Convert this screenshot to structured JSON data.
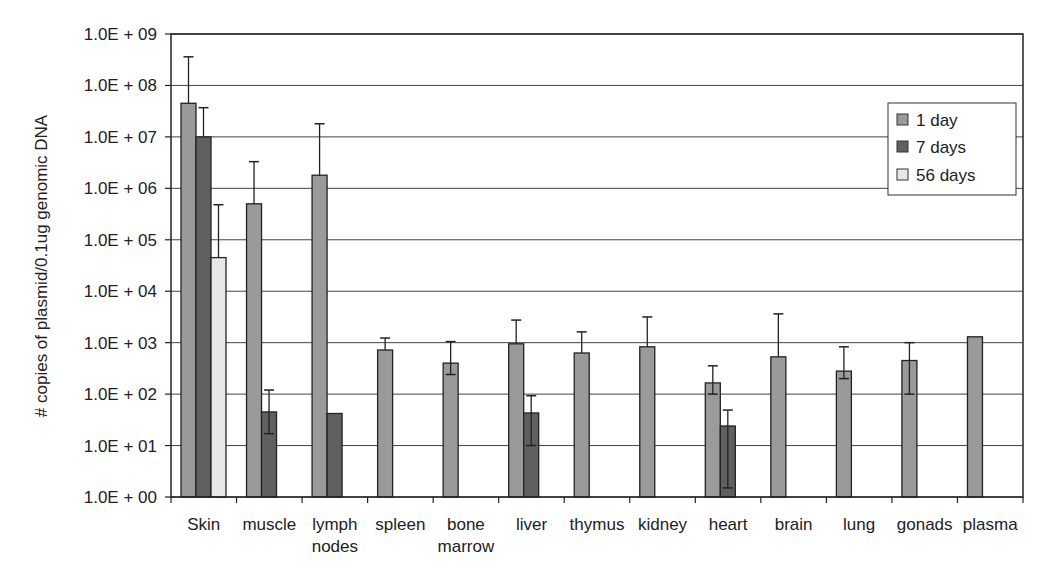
{
  "chart_data": {
    "type": "bar",
    "title": "",
    "xlabel": "",
    "ylabel": "# copies of plasmid/0.1ug genomic DNA",
    "yscale": "log",
    "ylim": [
      1,
      1000000000
    ],
    "yticks": [
      "1.0E + 00",
      "1.0E + 01",
      "1.0E + 02",
      "1.0E + 03",
      "1.0E + 04",
      "1.0E + 05",
      "1.0E + 06",
      "1.0E + 07",
      "1.0E + 08",
      "1.0E + 09"
    ],
    "grid": true,
    "legend_position": "upper right",
    "categories": [
      "Skin",
      "muscle",
      "lymph nodes",
      "spleen",
      "bone marrow",
      "liver",
      "thymus",
      "kidney",
      "heart",
      "brain",
      "lung",
      "gonads",
      "plasma"
    ],
    "category_lines": [
      [
        "Skin"
      ],
      [
        "muscle"
      ],
      [
        "lymph",
        "nodes"
      ],
      [
        "spleen"
      ],
      [
        "bone",
        "marrow"
      ],
      [
        "liver"
      ],
      [
        "thymus"
      ],
      [
        "kidney"
      ],
      [
        "heart"
      ],
      [
        "brain"
      ],
      [
        "lung"
      ],
      [
        "gonads"
      ],
      [
        "plasma"
      ]
    ],
    "series": [
      {
        "name": "1 day",
        "color": "#9a9a9a",
        "values": [
          45000000,
          500000,
          1800000,
          720,
          400,
          950,
          630,
          830,
          165,
          530,
          280,
          450,
          1300
        ],
        "error_upper": [
          360000000,
          3300000,
          18000000,
          1230,
          1050,
          2750,
          1620,
          3160,
          355,
          3630,
          830,
          1000,
          null
        ],
        "error_lower": [
          null,
          null,
          null,
          null,
          240,
          null,
          null,
          null,
          100,
          null,
          200,
          100,
          null
        ]
      },
      {
        "name": "7 days",
        "color": "#606060",
        "values": [
          10000000,
          45,
          42,
          null,
          null,
          43,
          null,
          null,
          24,
          null,
          null,
          null,
          null
        ],
        "error_upper": [
          37000000,
          120,
          null,
          null,
          null,
          93,
          null,
          null,
          49,
          null,
          null,
          null,
          null
        ],
        "error_lower": [
          null,
          17,
          null,
          null,
          null,
          10,
          null,
          null,
          1.5,
          null,
          null,
          null,
          null
        ]
      },
      {
        "name": "56 days",
        "color": "#e8e8e8",
        "values": [
          45000,
          null,
          null,
          null,
          null,
          null,
          null,
          null,
          null,
          null,
          null,
          null,
          null
        ],
        "error_upper": [
          480000,
          null,
          null,
          null,
          null,
          null,
          null,
          null,
          null,
          null,
          null,
          null,
          null
        ],
        "error_lower": [
          null,
          null,
          null,
          null,
          null,
          null,
          null,
          null,
          null,
          null,
          null,
          null,
          null
        ]
      }
    ]
  },
  "legend": {
    "items": [
      {
        "label": "1 day",
        "color": "#9a9a9a"
      },
      {
        "label": "7 days",
        "color": "#606060"
      },
      {
        "label": "56 days",
        "color": "#e8e8e8"
      }
    ]
  }
}
